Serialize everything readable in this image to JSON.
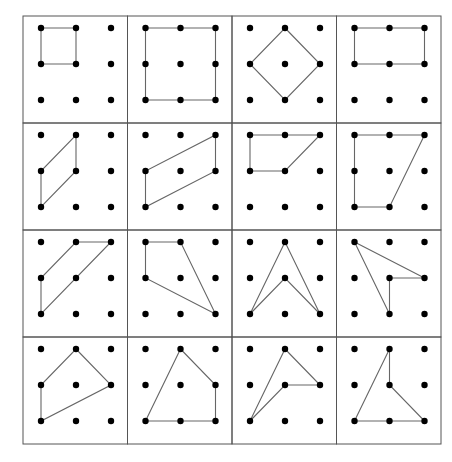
{
  "figure": {
    "grid": {
      "rows": 4,
      "cols": 4,
      "left": 23,
      "top": 16,
      "cell_w": 104.5,
      "cell_h": 107
    },
    "lattice": {
      "offset_x": 18,
      "offset_y": 12,
      "spacing_x": 35,
      "spacing_y": 36
    },
    "colors": {
      "border": "#555555",
      "dot": "#000000",
      "line": "#666666",
      "background": "#ffffff"
    },
    "panels": [
      {
        "id": 1,
        "shape": "square-small",
        "points": [
          [
            0,
            0
          ],
          [
            1,
            0
          ],
          [
            1,
            1
          ],
          [
            0,
            1
          ]
        ]
      },
      {
        "id": 2,
        "shape": "square-large",
        "points": [
          [
            0,
            0
          ],
          [
            2,
            0
          ],
          [
            2,
            2
          ],
          [
            0,
            2
          ]
        ]
      },
      {
        "id": 3,
        "shape": "diamond",
        "points": [
          [
            1,
            0
          ],
          [
            2,
            1
          ],
          [
            1,
            2
          ],
          [
            0,
            1
          ]
        ]
      },
      {
        "id": 4,
        "shape": "rectangle",
        "points": [
          [
            0,
            0
          ],
          [
            2,
            0
          ],
          [
            2,
            1
          ],
          [
            0,
            1
          ]
        ]
      },
      {
        "id": 5,
        "shape": "parallelogram-small",
        "points": [
          [
            1,
            0
          ],
          [
            1,
            1
          ],
          [
            0,
            2
          ],
          [
            0,
            1
          ]
        ]
      },
      {
        "id": 6,
        "shape": "parallelogram-large",
        "points": [
          [
            2,
            0
          ],
          [
            2,
            1
          ],
          [
            0,
            2
          ],
          [
            0,
            1
          ]
        ]
      },
      {
        "id": 7,
        "shape": "trapezoid",
        "points": [
          [
            0,
            0
          ],
          [
            2,
            0
          ],
          [
            1,
            1
          ],
          [
            0,
            1
          ]
        ]
      },
      {
        "id": 8,
        "shape": "trapezoid-tall",
        "points": [
          [
            0,
            0
          ],
          [
            2,
            0
          ],
          [
            1,
            2
          ],
          [
            0,
            2
          ]
        ]
      },
      {
        "id": 9,
        "shape": "quadrilateral",
        "points": [
          [
            1,
            0
          ],
          [
            2,
            0
          ],
          [
            0,
            2
          ],
          [
            0,
            1
          ]
        ]
      },
      {
        "id": 10,
        "shape": "quadrilateral",
        "points": [
          [
            0,
            0
          ],
          [
            1,
            0
          ],
          [
            2,
            2
          ],
          [
            0,
            1
          ]
        ]
      },
      {
        "id": 11,
        "shape": "arrowhead",
        "points": [
          [
            1,
            0
          ],
          [
            2,
            2
          ],
          [
            1,
            1
          ],
          [
            0,
            2
          ]
        ]
      },
      {
        "id": 12,
        "shape": "concave-quadrilateral",
        "points": [
          [
            0,
            0
          ],
          [
            2,
            1
          ],
          [
            1,
            1
          ],
          [
            1,
            2
          ]
        ]
      },
      {
        "id": 13,
        "shape": "quadrilateral",
        "points": [
          [
            1,
            0
          ],
          [
            2,
            1
          ],
          [
            0,
            2
          ],
          [
            0,
            1
          ]
        ]
      },
      {
        "id": 14,
        "shape": "pentagon",
        "points": [
          [
            1,
            0
          ],
          [
            2,
            1
          ],
          [
            2,
            2
          ],
          [
            1,
            2
          ],
          [
            0,
            2
          ]
        ]
      },
      {
        "id": 15,
        "shape": "concave-quadrilateral",
        "points": [
          [
            1,
            0
          ],
          [
            2,
            1
          ],
          [
            1,
            1
          ],
          [
            0,
            2
          ]
        ]
      },
      {
        "id": 16,
        "shape": "concave-pentagon",
        "points": [
          [
            1,
            0
          ],
          [
            1,
            1
          ],
          [
            2,
            2
          ],
          [
            1,
            2
          ],
          [
            0,
            2
          ]
        ]
      }
    ]
  }
}
